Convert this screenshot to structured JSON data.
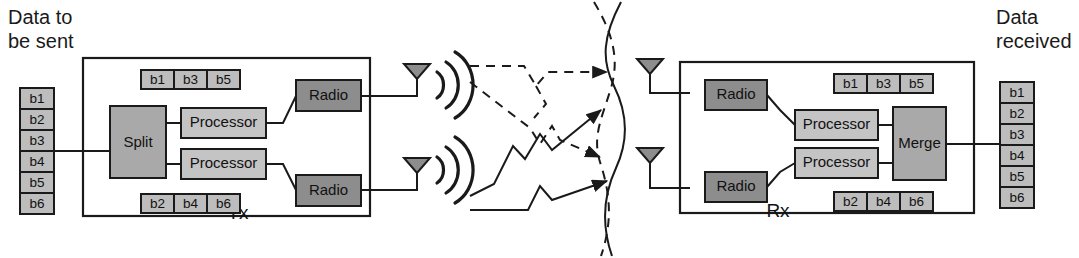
{
  "figure": {
    "background_color": "#ffffff",
    "line_color": "#1a1a1a"
  },
  "labels": {
    "data_to_be_sent_line1": "Data to",
    "data_to_be_sent_line2": "be sent",
    "data_received_line1": "Data",
    "data_received_line2": "received",
    "tx": "Tx",
    "rx": "Rx"
  },
  "colors": {
    "split_fill": "#a9a9a9",
    "merge_fill": "#a9a9a9",
    "processor_fill": "#c4c4c4",
    "radio_fill": "#8d8d8d",
    "bit_fill": "#bdbdbd",
    "antenna_fill": "#8d8d8d",
    "stroke": "#1a1a1a"
  },
  "input_stack": {
    "name": "data-to-be-sent-stack",
    "bits": [
      "b1",
      "b2",
      "b3",
      "b4",
      "b5",
      "b6"
    ]
  },
  "output_stack": {
    "name": "data-received-stack",
    "bits": [
      "b1",
      "b2",
      "b3",
      "b4",
      "b5",
      "b6"
    ]
  },
  "tx": {
    "label": "Tx",
    "split_label": "Split",
    "processors": [
      {
        "label": "Processor",
        "stream": "upper"
      },
      {
        "label": "Processor",
        "stream": "lower"
      }
    ],
    "radios": [
      {
        "label": "Radio",
        "stream": "upper"
      },
      {
        "label": "Radio",
        "stream": "lower"
      }
    ],
    "stream_top_bits": [
      "b1",
      "b3",
      "b5"
    ],
    "stream_bottom_bits": [
      "b2",
      "b4",
      "b6"
    ],
    "antennas": 2
  },
  "rx": {
    "label": "Rx",
    "merge_label": "Merge",
    "processors": [
      {
        "label": "Processor",
        "stream": "upper"
      },
      {
        "label": "Processor",
        "stream": "lower"
      }
    ],
    "radios": [
      {
        "label": "Radio",
        "stream": "upper"
      },
      {
        "label": "Radio",
        "stream": "lower"
      }
    ],
    "stream_top_bits": [
      "b1",
      "b3",
      "b5"
    ],
    "stream_bottom_bits": [
      "b2",
      "b4",
      "b6"
    ],
    "antennas": 2
  },
  "channel": {
    "description": "Multipath propagation between two transmit and two receive antennas",
    "solid_paths": 2,
    "dashed_paths": 3,
    "fading_curves": [
      {
        "style": "solid",
        "name": "fading-curve-solid"
      },
      {
        "style": "dashed",
        "name": "fading-curve-dashed"
      }
    ]
  },
  "icons": {
    "antenna": "antenna-icon",
    "radio_waves": "radio-waves-icon",
    "arrow": "arrow-icon"
  }
}
